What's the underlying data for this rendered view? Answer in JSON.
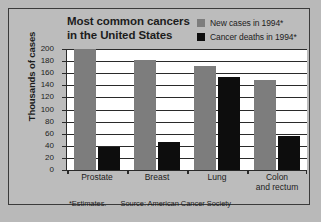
{
  "chart_data": {
    "type": "bar",
    "title": "Most common cancers in the United States",
    "title_line1": "Most common cancers",
    "title_line2": "in the United States",
    "xlabel": "",
    "ylabel": "Thousands of cases",
    "ylim": [
      0,
      200
    ],
    "ytick_values": [
      200,
      180,
      160,
      140,
      120,
      100,
      80,
      60,
      40,
      20,
      0
    ],
    "ytick_labels": [
      "200",
      "180",
      "160",
      "140",
      "120",
      "100",
      "80",
      "60",
      "40",
      "20",
      "0"
    ],
    "grid": true,
    "legend_position": "top-right",
    "categories": [
      "Prostate",
      "Breast",
      "Lung",
      "Colon and rectum"
    ],
    "category_labels": [
      {
        "line1": "Prostate",
        "line2": ""
      },
      {
        "line1": "Breast",
        "line2": ""
      },
      {
        "line1": "Lung",
        "line2": ""
      },
      {
        "line1": "Colon",
        "line2": "and rectum"
      }
    ],
    "series": [
      {
        "name": "New cases in 1994*",
        "color": "#7d7d7d",
        "values": [
          200,
          182,
          172,
          149
        ]
      },
      {
        "name": "Cancer deaths in 1994*",
        "color": "#0d0d0d",
        "values": [
          38,
          46,
          153,
          56
        ]
      }
    ],
    "annotations": {
      "footnote_estimates": "*Estimates.",
      "footnote_source": "Source: American Cancer Society"
    }
  },
  "legend": {
    "items": [
      {
        "label": "New cases in 1994*",
        "swatch": "gray-square",
        "color": "#7d7d7d"
      },
      {
        "label": "Cancer deaths in 1994*",
        "swatch": "black-square",
        "color": "#0d0d0d"
      }
    ]
  },
  "colors": {
    "background": "#b9b9b9",
    "panel": "#bcbcbc",
    "plot_background": "#ffffff",
    "axis": "#2a2a2a",
    "text": "#1c1c1c",
    "series_new": "#7d7d7d",
    "series_deaths": "#0d0d0d"
  }
}
